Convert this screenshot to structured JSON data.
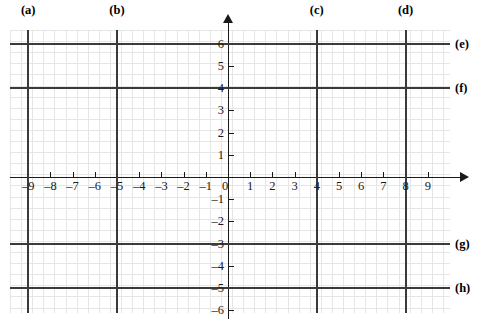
{
  "figure": {
    "type": "coordinate-grid",
    "origin_label": "0",
    "x_axis": {
      "label_values": [
        "–9",
        "–8",
        "–7",
        "–6",
        "–5",
        "–4",
        "–3",
        "–2",
        "–1",
        "1",
        "2",
        "3",
        "4",
        "5",
        "6",
        "7",
        "8",
        "9"
      ],
      "numeric": [
        -9,
        -8,
        -7,
        -6,
        -5,
        -4,
        -3,
        -2,
        -1,
        1,
        2,
        3,
        4,
        5,
        6,
        7,
        8,
        9
      ],
      "min": -9.8,
      "max": 10.0
    },
    "y_axis": {
      "label_values": [
        "6",
        "5",
        "4",
        "3",
        "2",
        "1",
        "–1",
        "–2",
        "–3",
        "–4",
        "–5",
        "–6"
      ],
      "numeric": [
        6,
        5,
        4,
        3,
        2,
        1,
        -1,
        -2,
        -3,
        -4,
        -5,
        -6
      ],
      "min": -6.2,
      "max": 6.6
    },
    "vertical_lines": [
      {
        "letter": "(a)",
        "x": -9
      },
      {
        "letter": "(b)",
        "x": -5
      },
      {
        "letter": "(c)",
        "x": 4
      },
      {
        "letter": "(d)",
        "x": 8
      }
    ],
    "horizontal_lines": [
      {
        "letter": "(e)",
        "y": 6
      },
      {
        "letter": "(f)",
        "y": 4
      },
      {
        "letter": "(g)",
        "y": -3
      },
      {
        "letter": "(h)",
        "y": -5
      }
    ],
    "colors": {
      "grid_minor": "#e6e6e6",
      "grid_major": "#d2d2d2",
      "axis": "#1a1a1a",
      "answer_line": "#3a3a3a",
      "background": "#ffffff"
    }
  }
}
